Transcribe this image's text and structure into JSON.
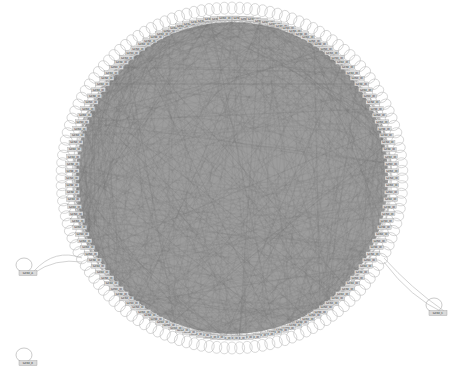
{
  "diagram": {
    "type": "network-circular-layout",
    "node_count_ring": 140,
    "ring": {
      "cx": 232,
      "cy": 178,
      "rx": 160,
      "ry": 160
    },
    "colors": {
      "background": "#ffffff",
      "edge": "#7a7a7a",
      "interior_fill": "#8c8c8c",
      "node_fill": "#d9d9d9",
      "node_stroke": "#9a9a9a",
      "self_loop": "#b5b5b5"
    },
    "node_label_text": "GENE_ID",
    "outlier_nodes": [
      {
        "x": 28,
        "y": 273,
        "label": "GENE_A",
        "self_loop": true,
        "edge_to_ring": true
      },
      {
        "x": 28,
        "y": 363,
        "label": "GENE_B",
        "self_loop": true,
        "edge_to_ring": false
      },
      {
        "x": 438,
        "y": 313,
        "label": "GENE_C",
        "self_loop": true,
        "edge_to_ring": true
      }
    ]
  }
}
